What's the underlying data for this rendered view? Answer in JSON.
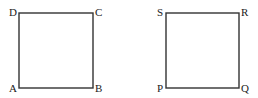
{
  "diagram": {
    "type": "two squares",
    "squares": [
      {
        "name": "ABCD",
        "labels": {
          "A": "A",
          "B": "B",
          "C": "C",
          "D": "D"
        },
        "corners": {
          "D": [
            19,
            13
          ],
          "C": [
            93,
            13
          ],
          "B": [
            93,
            88
          ],
          "A": [
            19,
            88
          ]
        }
      },
      {
        "name": "PQRS",
        "labels": {
          "P": "P",
          "Q": "Q",
          "R": "R",
          "S": "S"
        },
        "corners": {
          "S": [
            166,
            13
          ],
          "R": [
            239,
            13
          ],
          "Q": [
            239,
            88
          ],
          "P": [
            166,
            88
          ]
        }
      }
    ],
    "stroke_color": "#333333",
    "label_color": "#222222"
  }
}
